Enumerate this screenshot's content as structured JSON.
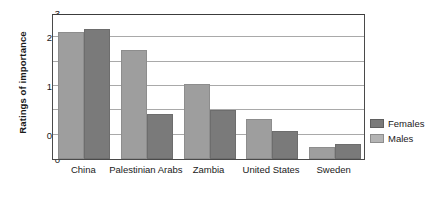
{
  "chart_data": {
    "type": "bar",
    "title": "",
    "xlabel": "",
    "ylabel": "Ratings of importance",
    "ylim": [
      0,
      3
    ],
    "yticks": [
      "0",
      "0.5",
      "1",
      "1.5",
      "2",
      "2.5",
      "3"
    ],
    "ytick_values": [
      0,
      0.5,
      1,
      1.5,
      2,
      2.5,
      3
    ],
    "grid": true,
    "legend_position": "right",
    "categories": [
      "China",
      "Palestinian Arabs",
      "Zambia",
      "United States",
      "Sweden"
    ],
    "series": [
      {
        "name": "Males",
        "values": [
          2.6,
          2.25,
          1.55,
          0.83,
          0.25
        ]
      },
      {
        "name": "Females",
        "values": [
          2.67,
          0.93,
          1.0,
          0.58,
          0.3
        ]
      }
    ]
  },
  "legend": {
    "items": [
      {
        "label": "Females",
        "swatch": "females"
      },
      {
        "label": "Males",
        "swatch": "males"
      }
    ]
  },
  "colors": {
    "males_bar": "#9e9e9e",
    "females_bar": "#7a7a7a",
    "gridline": "#a9a9a9",
    "axis": "#4a4a4a",
    "text": "#1a1a1a"
  }
}
